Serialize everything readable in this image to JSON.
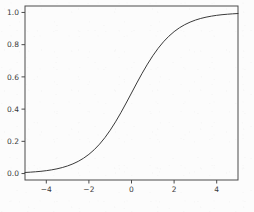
{
  "figure": {
    "background_color": "#fcfcfc",
    "axes_color": "#4a4a4a",
    "line_color": "#3a3a3a",
    "tick_label_color": "#3a3a3a"
  },
  "chart_data": {
    "type": "line",
    "title": "",
    "subtitle": "",
    "xlabel": "",
    "ylabel": "",
    "xlim": [
      -5,
      5
    ],
    "ylim": [
      -0.04,
      1.04
    ],
    "grid": false,
    "legend": null,
    "legend_position": "none",
    "annotations": [],
    "xticks": [
      -4,
      -2,
      0,
      2,
      4
    ],
    "xticklabels": [
      "−4",
      "−2",
      "0",
      "2",
      "4"
    ],
    "yticks": [
      0.0,
      0.2,
      0.4,
      0.6,
      0.8,
      1.0
    ],
    "yticklabels": [
      "0.0",
      "0.2",
      "0.4",
      "0.6",
      "0.8",
      "1.0"
    ],
    "series": [
      {
        "name": "sigmoid",
        "function": "1 / (1 + exp(-x))",
        "color": "#3a3a3a",
        "linewidth": 1,
        "x": [
          -5.0,
          -4.75,
          -4.5,
          -4.25,
          -4.0,
          -3.75,
          -3.5,
          -3.25,
          -3.0,
          -2.75,
          -2.5,
          -2.25,
          -2.0,
          -1.75,
          -1.5,
          -1.25,
          -1.0,
          -0.75,
          -0.5,
          -0.25,
          0.0,
          0.25,
          0.5,
          0.75,
          1.0,
          1.25,
          1.5,
          1.75,
          2.0,
          2.25,
          2.5,
          2.75,
          3.0,
          3.25,
          3.5,
          3.75,
          4.0,
          4.25,
          4.5,
          4.75,
          5.0
        ],
        "y": [
          0.0067,
          0.0086,
          0.011,
          0.014,
          0.018,
          0.023,
          0.0293,
          0.0373,
          0.0474,
          0.0601,
          0.0759,
          0.0953,
          0.1192,
          0.148,
          0.1824,
          0.2227,
          0.2689,
          0.3208,
          0.3775,
          0.4378,
          0.5,
          0.5622,
          0.6225,
          0.6792,
          0.7311,
          0.7773,
          0.8176,
          0.852,
          0.8808,
          0.9047,
          0.9241,
          0.9399,
          0.9526,
          0.9627,
          0.9707,
          0.977,
          0.982,
          0.986,
          0.989,
          0.9914,
          0.9933
        ]
      }
    ]
  }
}
